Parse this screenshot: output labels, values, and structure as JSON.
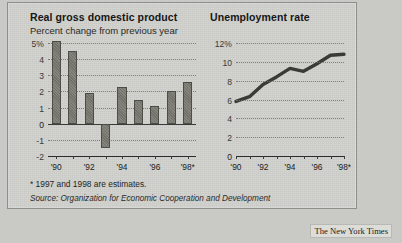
{
  "credit": "The New York Times",
  "notes": {
    "footnote": "* 1997 and 1998 are estimates.",
    "source": "Source: Organization for Economic Cooperation and Development"
  },
  "chart_data": [
    {
      "type": "bar",
      "title": "Real gross domestic product",
      "subtitle": "Percent change from previous year",
      "xlabel": "",
      "ylabel": "",
      "categories": [
        "1990",
        "1991",
        "1992",
        "1993",
        "1994",
        "1995",
        "1996",
        "1997*",
        "1998*"
      ],
      "values": [
        5.1,
        4.5,
        1.9,
        -1.5,
        2.3,
        1.5,
        1.1,
        2.0,
        2.6
      ],
      "ylim": [
        -2,
        5
      ],
      "yticks": [
        5,
        4,
        3,
        2,
        1,
        0,
        -1,
        -2
      ],
      "ytick_labels": [
        "5%",
        "4",
        "3",
        "2",
        "1",
        "0",
        "-1",
        "-2"
      ],
      "xtick_labels": [
        "'90",
        "'92",
        "'94",
        "'96",
        "'98*"
      ],
      "xtick_categories": [
        "1990",
        "1992",
        "1994",
        "1996",
        "1998*"
      ],
      "grid": true,
      "legend": "none",
      "bar_color": "#77776f"
    },
    {
      "type": "line",
      "title": "Unemployment rate",
      "subtitle": "",
      "xlabel": "",
      "ylabel": "",
      "x": [
        "1990",
        "1991",
        "1992",
        "1993",
        "1994",
        "1995",
        "1996",
        "1997*",
        "1998*"
      ],
      "values": [
        5.8,
        6.3,
        7.6,
        8.4,
        9.3,
        9.0,
        9.8,
        10.7,
        10.8
      ],
      "ylim": [
        0,
        12
      ],
      "yticks": [
        12,
        10,
        8,
        6,
        4,
        2,
        0
      ],
      "ytick_labels": [
        "12%",
        "10",
        "8",
        "6",
        "4",
        "2",
        "0"
      ],
      "xtick_labels": [
        "'90",
        "'92",
        "'94",
        "'96",
        "'98*"
      ],
      "xtick_categories": [
        "1990",
        "1992",
        "1994",
        "1996",
        "1998*"
      ],
      "grid": true,
      "legend": "none",
      "line_color": "#3a3a36"
    }
  ]
}
